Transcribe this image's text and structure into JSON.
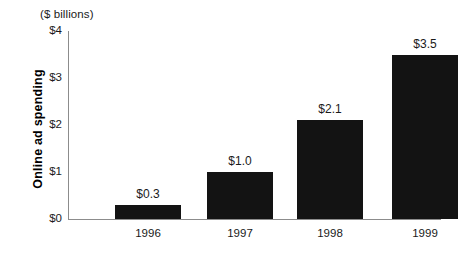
{
  "chart_data": {
    "type": "bar",
    "title": "",
    "subtitle": "",
    "unit_caption": "($ billions)",
    "xlabel": "",
    "ylabel": "Online ad spending",
    "categories": [
      "1996",
      "1997",
      "1998",
      "1999"
    ],
    "values": [
      0.3,
      1.0,
      2.1,
      3.5
    ],
    "value_labels": [
      "$0.3",
      "$1.0",
      "$2.1",
      "$3.5"
    ],
    "ylim": [
      0,
      4
    ],
    "yticks": [
      0,
      1,
      2,
      3,
      4
    ],
    "ytick_labels": [
      "$0",
      "$1",
      "$2",
      "$3",
      "$4"
    ],
    "grid": false,
    "legend": false,
    "legend_position": "none",
    "bar_color": "#131313",
    "axis_color": "#8c8c8c",
    "background_color": "#ffffff",
    "text_color": "#1a1a1a"
  }
}
